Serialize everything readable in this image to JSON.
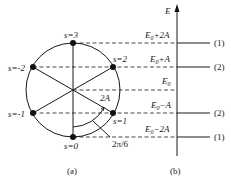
{
  "panel_a": {
    "caption": "(a)",
    "states": [
      {
        "label": "s=3",
        "s": 3
      },
      {
        "label": "s=2",
        "s": 2
      },
      {
        "label": "s=1",
        "s": 1
      },
      {
        "label": "s=0",
        "s": 0
      },
      {
        "label": "s=-1",
        "s": -1
      },
      {
        "label": "s=-2",
        "s": -2
      }
    ],
    "angle_label": "2π/6",
    "coupling_label": "2A"
  },
  "panel_b": {
    "caption": "(b)",
    "axis_label": "E",
    "levels": [
      {
        "energy": "E0+2A",
        "base": "E",
        "sub": "0",
        "suffix": "+2A",
        "degeneracy": "(1)"
      },
      {
        "energy": "E0+A",
        "base": "E",
        "sub": "0",
        "suffix": "+A",
        "degeneracy": "(2)"
      },
      {
        "energy": "E0",
        "base": "E",
        "sub": "0",
        "suffix": "",
        "degeneracy": ""
      },
      {
        "energy": "E0-A",
        "base": "E",
        "sub": "0",
        "suffix": "−A",
        "degeneracy": "(2)"
      },
      {
        "energy": "E0-2A",
        "base": "E",
        "sub": "0",
        "suffix": "−2A",
        "degeneracy": "(1)"
      }
    ]
  }
}
